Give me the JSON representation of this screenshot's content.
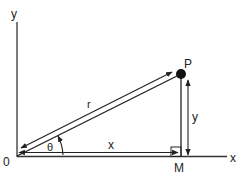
{
  "diagram": {
    "labels": {
      "y_axis": "y",
      "x_axis": "x",
      "origin": "0",
      "point": "P",
      "foot": "M",
      "radius": "r",
      "angle": "θ",
      "x_length": "x",
      "y_length": "y"
    },
    "colors": {
      "stroke": "#222222",
      "background": "#ffffff"
    }
  }
}
